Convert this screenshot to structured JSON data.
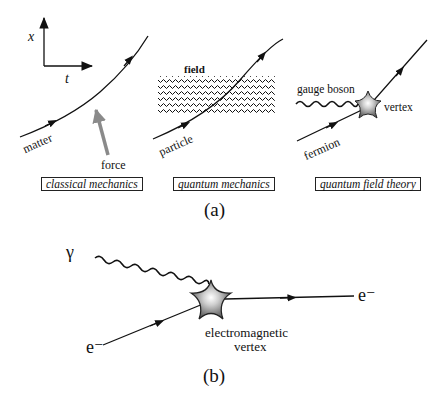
{
  "figure": {
    "panel_a": {
      "caption": "(a)",
      "axes": {
        "vertical_label": "x",
        "horizontal_label": "t"
      },
      "classical": {
        "title": "classical mechanics",
        "matter_label": "matter",
        "force_label": "force"
      },
      "quantum": {
        "title": "quantum mechanics",
        "field_label": "field",
        "particle_label": "particle"
      },
      "qft": {
        "title": "quantum field theory",
        "boson_label": "gauge boson",
        "vertex_label": "vertex",
        "fermion_label": "fermion"
      }
    },
    "panel_b": {
      "caption": "(b)",
      "photon_label": "γ",
      "incoming_electron_label": "e⁻",
      "outgoing_electron_label": "e⁻",
      "vertex_label_line1": "electromagnetic",
      "vertex_label_line2": "vertex"
    },
    "colors": {
      "line": "#111111",
      "force_arrow": "#8a8a8a",
      "vertex_fill": "#6f6f6f",
      "vertex_glow": "#ffffff"
    }
  }
}
